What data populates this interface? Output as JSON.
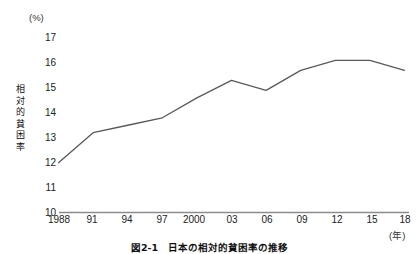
{
  "figure": {
    "caption": "図2-1　日本の相対的貧困率の推移",
    "y_axis_unit": "(%)",
    "y_axis_title_chars": [
      "相",
      "対",
      "的",
      "貧",
      "困",
      "率"
    ],
    "x_axis_unit": "(年)"
  },
  "chart_data": {
    "type": "line",
    "title": "図2-1　日本の相対的貧困率の推移",
    "xlabel": "(年)",
    "ylabel": "相対的貧困率",
    "yunit": "(%)",
    "grid": false,
    "legend": "none",
    "line_color": "#595959",
    "ylim": [
      10,
      17
    ],
    "yticks": [
      10,
      11,
      12,
      13,
      14,
      15,
      16,
      17
    ],
    "categories": [
      "1988",
      "91",
      "94",
      "97",
      "2000",
      "03",
      "06",
      "09",
      "12",
      "15",
      "18"
    ],
    "x_values": [
      1988,
      1991,
      1994,
      1997,
      2000,
      2003,
      2006,
      2009,
      2012,
      2015,
      2018
    ],
    "values": [
      12.0,
      13.2,
      13.5,
      13.8,
      14.6,
      15.3,
      14.9,
      15.7,
      16.1,
      16.1,
      15.7
    ]
  }
}
